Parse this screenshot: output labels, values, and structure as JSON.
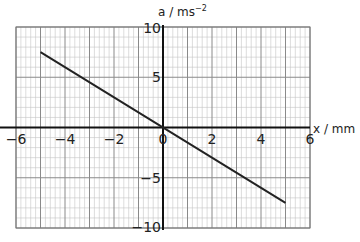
{
  "chart_data": {
    "type": "line",
    "title": "",
    "xlabel": "x / mm",
    "ylabel": "a / ms⁻²",
    "xlim": [
      -6,
      6
    ],
    "ylim": [
      -10,
      10
    ],
    "x_ticks": [
      -6,
      -4,
      -2,
      0,
      2,
      4,
      6
    ],
    "x_tick_labels": [
      "−6",
      "−4",
      "−2",
      "0",
      "2",
      "4",
      "6"
    ],
    "y_ticks": [
      10,
      5,
      -5,
      -10
    ],
    "y_tick_labels": [
      "10",
      "5",
      "−5",
      "−10"
    ],
    "grid": true,
    "grid_minor_x": 0.2,
    "grid_minor_y": 1,
    "grid_major_x": 1,
    "grid_major_y": 5,
    "legend": null,
    "series": [
      {
        "name": "a vs x",
        "x": [
          -5,
          5
        ],
        "y": [
          7.5,
          -7.5
        ],
        "color": "#222222"
      }
    ]
  },
  "labels": {
    "x_axis": "x / mm",
    "y_axis_main": "a / ms",
    "y_axis_sup": "−2"
  }
}
